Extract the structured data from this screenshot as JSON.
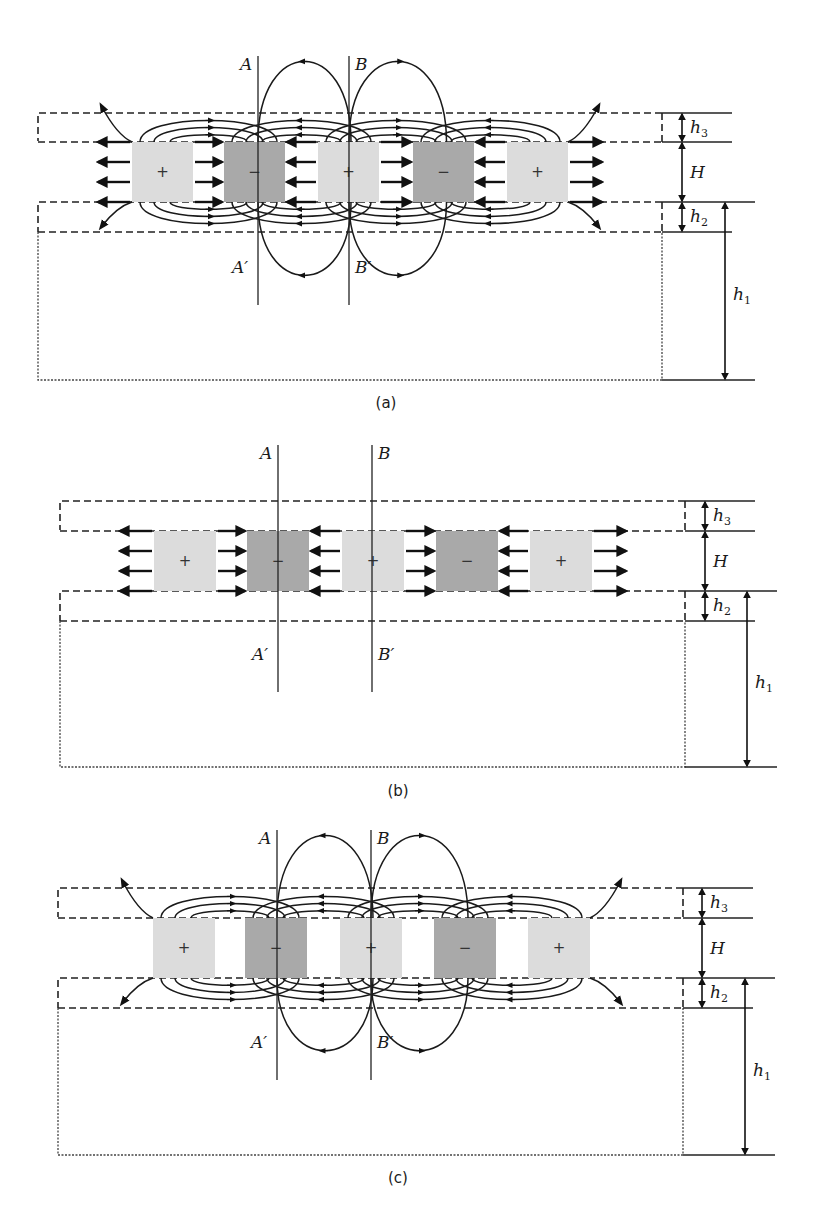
{
  "colors": {
    "positive_block": "#dcdcdc",
    "negative_block": "#a9a9a9",
    "line": "#1a1a1a"
  },
  "labels": {
    "A": "A",
    "B": "B",
    "A_prime": "A′",
    "B_prime": "B′",
    "h": "h",
    "h1_sub": "1",
    "h2_sub": "2",
    "h3_sub": "3",
    "H": "H"
  },
  "block_signs": [
    "+",
    "−",
    "+",
    "−",
    "+"
  ],
  "panels": [
    {
      "id": "a",
      "caption": "(a)",
      "field_type": "fringing-and-through"
    },
    {
      "id": "b",
      "caption": "(b)",
      "field_type": "through-only"
    },
    {
      "id": "c",
      "caption": "(c)",
      "field_type": "fringing-only"
    }
  ]
}
